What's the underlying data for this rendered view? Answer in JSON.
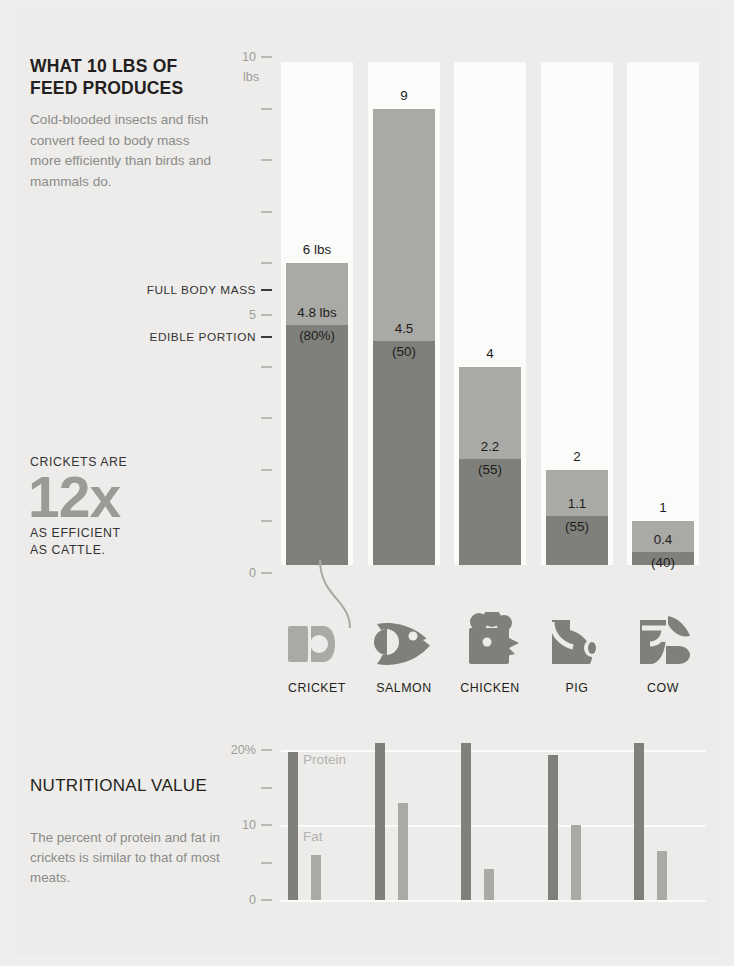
{
  "meta": {
    "background": "#edecea",
    "light_gray": "#a9a9a6",
    "dark_gray": "#7f7f7c",
    "track_white": "#fbfbfa",
    "text_dark": "#231f20",
    "text_muted": "#8b8b88"
  },
  "feed_section": {
    "title": "WHAT 10 LBS OF FEED PRODUCES",
    "subtitle": "Cold-blooded insects and fish convert feed to body mass more efficiently than birds and mammals do.",
    "axis_unit_label": "lbs",
    "annotations": {
      "full_body_mass": "FULL BODY MASS",
      "edible_portion": "EDIBLE PORTION"
    },
    "efficiency_callout": {
      "line1": "CRICKETS ARE",
      "big": "12x",
      "line2": "AS EFFICIENT",
      "line3": "AS CATTLE."
    }
  },
  "nutrition_section": {
    "title": "NUTRITIONAL VALUE",
    "subtitle": "The percent of protein and fat in crickets is similar to that of most meats.",
    "legend": {
      "protein": "Protein",
      "fat": "Fat"
    }
  },
  "chart_data": [
    {
      "type": "bar",
      "id": "feed-conversion",
      "title": "WHAT 10 LBS OF FEED PRODUCES",
      "subtitle": "Cold-blooded insects and fish convert feed to body mass more efficiently than birds and mammals do.",
      "stacked": true,
      "xlabel": "",
      "ylabel": "lbs",
      "ylim": [
        0,
        10
      ],
      "ytick_labels": [
        "0",
        "5",
        "10"
      ],
      "yticks": [
        0,
        1,
        2,
        3,
        4,
        5,
        6,
        7,
        8,
        9,
        10
      ],
      "grid": false,
      "track_max": 10,
      "annotations": [
        "FULL BODY MASS",
        "EDIBLE PORTION"
      ],
      "categories": [
        "CRICKET",
        "SALMON",
        "CHICKEN",
        "PIG",
        "COW"
      ],
      "series": [
        {
          "name": "Full body mass",
          "values": [
            6,
            9,
            4,
            2,
            1
          ]
        },
        {
          "name": "Edible portion",
          "values": [
            4.8,
            4.5,
            2.2,
            1.1,
            0.4
          ]
        }
      ],
      "bars": [
        {
          "category": "CRICKET",
          "icon": "cricket-icon",
          "total": 6,
          "total_label": "6 lbs",
          "edible": 4.8,
          "edible_label": "4.8 lbs",
          "percent_label": "(80%)"
        },
        {
          "category": "SALMON",
          "icon": "salmon-icon",
          "total": 9,
          "total_label": "9",
          "edible": 4.5,
          "edible_label": "4.5",
          "percent_label": "(50)"
        },
        {
          "category": "CHICKEN",
          "icon": "chicken-icon",
          "total": 4,
          "total_label": "4",
          "edible": 2.2,
          "edible_label": "2.2",
          "percent_label": "(55)"
        },
        {
          "category": "PIG",
          "icon": "pig-icon",
          "total": 2,
          "total_label": "2",
          "edible": 1.1,
          "edible_label": "1.1",
          "percent_label": "(55)"
        },
        {
          "category": "COW",
          "icon": "cow-icon",
          "total": 1,
          "total_label": "1",
          "edible": 0.4,
          "edible_label": "0.4",
          "percent_label": "(40)"
        }
      ]
    },
    {
      "type": "bar",
      "id": "nutritional-value",
      "title": "NUTRITIONAL VALUE",
      "subtitle": "The percent of protein and fat in crickets is similar to that of most meats.",
      "xlabel": "",
      "ylabel": "%",
      "ylim": [
        0,
        20
      ],
      "ytick_labels": [
        "0",
        "5",
        "10",
        "15",
        "20%"
      ],
      "yticks": [
        0,
        5,
        10,
        15,
        20
      ],
      "grid": true,
      "legend_position": "inside-left",
      "categories": [
        "CRICKET",
        "SALMON",
        "CHICKEN",
        "PIG",
        "COW"
      ],
      "series": [
        {
          "name": "Protein",
          "values": [
            19.7,
            21,
            21,
            19.3,
            21
          ]
        },
        {
          "name": "Fat",
          "values": [
            6,
            13,
            4.2,
            10,
            6.5
          ]
        }
      ]
    }
  ],
  "ticks": {
    "feed": [
      {
        "v": 10,
        "label": "10"
      },
      {
        "v": 9,
        "label": ""
      },
      {
        "v": 8,
        "label": ""
      },
      {
        "v": 7,
        "label": ""
      },
      {
        "v": 6,
        "label": ""
      },
      {
        "v": 5,
        "label": "5"
      },
      {
        "v": 4,
        "label": ""
      },
      {
        "v": 3,
        "label": ""
      },
      {
        "v": 2,
        "label": ""
      },
      {
        "v": 1,
        "label": ""
      },
      {
        "v": 0,
        "label": "0"
      }
    ],
    "nutrition": [
      {
        "v": 20,
        "label": "20%"
      },
      {
        "v": 15,
        "label": ""
      },
      {
        "v": 10,
        "label": "10"
      },
      {
        "v": 5,
        "label": ""
      },
      {
        "v": 0,
        "label": "0"
      }
    ]
  }
}
